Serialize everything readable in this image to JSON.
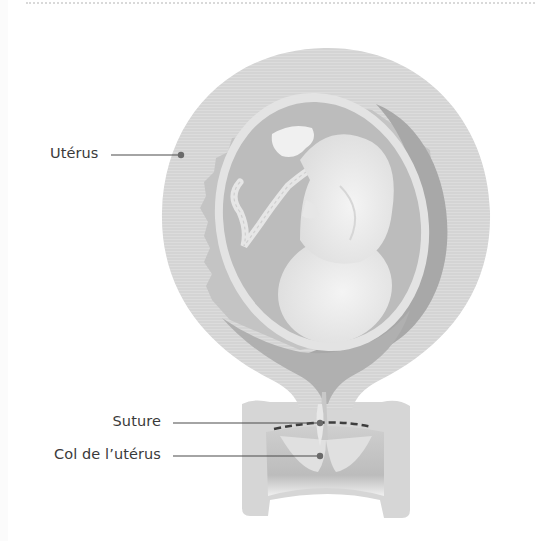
{
  "figure": {
    "labels": [
      {
        "id": "uterus",
        "text": "Utérus"
      },
      {
        "id": "suture",
        "text": "Suture"
      },
      {
        "id": "cervix",
        "text": "Col de l’utérus"
      }
    ],
    "colors": {
      "background": "#ffffff",
      "uterus_wall": "#d4d4d4",
      "inner_layer": "#c6c6c6",
      "amniotic_sac": "#bdbdbd",
      "sac_rim": "#e2e2e2",
      "fetus": "#ececec",
      "shadow": "#a6a6a6",
      "leader_line": "#4a4a4a",
      "text": "#3a3a3a"
    }
  }
}
